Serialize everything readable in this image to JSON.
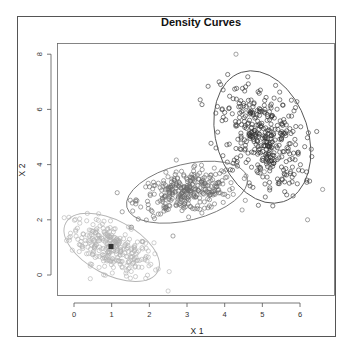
{
  "chart_data": {
    "type": "scatter",
    "title": "Density Curves",
    "xlabel": "X 1",
    "ylabel": "X 2",
    "xlim": [
      -0.5,
      6.9
    ],
    "ylim": [
      -0.75,
      8.4
    ],
    "x_ticks": [
      0,
      1,
      2,
      3,
      4,
      5,
      6
    ],
    "y_ticks": [
      0,
      2,
      4,
      6,
      8
    ],
    "grid": false,
    "legend": null,
    "series": [
      {
        "name": "cluster-1",
        "color": "#b0b0b0",
        "point_shape": "open-circle",
        "n_points_approx": 300,
        "center": [
          1.0,
          1.0
        ],
        "spread": [
          0.55,
          0.5
        ],
        "correlation": -0.55,
        "marked_center": [
          1.0,
          1.0
        ],
        "ellipse": {
          "cx": 1.0,
          "cy": 1.0,
          "rx_px": 52,
          "ry_px": 27,
          "angle_deg": 28,
          "color": "#b5b5b5"
        }
      },
      {
        "name": "cluster-2",
        "color": "#6a6a6a",
        "point_shape": "open-circle",
        "n_points_approx": 320,
        "center": [
          3.0,
          3.0
        ],
        "spread": [
          0.65,
          0.4
        ],
        "correlation": 0.35,
        "ellipse": {
          "cx": 3.0,
          "cy": 3.0,
          "rx_px": 62,
          "ry_px": 28,
          "angle_deg": -14,
          "color": "#777777"
        }
      },
      {
        "name": "cluster-3",
        "color": "#2f2f2f",
        "point_shape": "open-circle",
        "n_points_approx": 380,
        "center": [
          5.0,
          5.0
        ],
        "spread": [
          0.55,
          0.95
        ],
        "correlation": -0.35,
        "ellipse": {
          "cx": 5.0,
          "cy": 5.0,
          "rx_px": 46,
          "ry_px": 68,
          "angle_deg": -18,
          "color": "#555555"
        }
      }
    ],
    "outliers": [
      {
        "x": 4.3,
        "y": 8.0
      },
      {
        "x": 6.2,
        "y": 2.0
      },
      {
        "x": 6.6,
        "y": 3.1
      }
    ]
  },
  "frame": {
    "outer": [
      17,
      16,
      336,
      337
    ],
    "plot": [
      57,
      43,
      335,
      296
    ]
  }
}
